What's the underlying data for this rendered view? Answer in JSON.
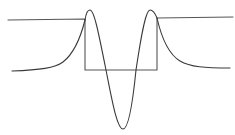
{
  "diagram": {
    "title": "",
    "colors": {
      "background": "#ffffff",
      "potential": "#555555",
      "wavefunction": "#3a3a3a"
    },
    "potential_well": {
      "outside_level_y": 20,
      "inside_level_y": 70,
      "left_wall_x": 85,
      "right_wall_x": 157,
      "left_extent_x": 8,
      "right_extent_x": 233,
      "right_outside_level_y": 17
    },
    "wavefunction": {
      "interior_peaks": [
        {
          "x": 90,
          "y": 10
        },
        {
          "x": 150,
          "y": 10
        }
      ],
      "interior_trough": {
        "x": 123,
        "y": 129
      },
      "zero_crossings": [
        {
          "x": 106,
          "y": 70
        },
        {
          "x": 136,
          "y": 70
        }
      ],
      "left_tail": {
        "start": {
          "x": 12,
          "y": 71
        },
        "end": {
          "x": 85,
          "y": 20
        }
      },
      "right_tail": {
        "start": {
          "x": 157,
          "y": 18
        },
        "end": {
          "x": 230,
          "y": 68
        }
      }
    }
  }
}
